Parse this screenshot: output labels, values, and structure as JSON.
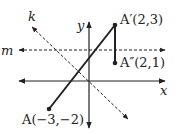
{
  "diagram": {
    "axes": {
      "x_label": "x",
      "y_label": "y"
    },
    "lines": {
      "k_label": "k",
      "m_label": "m"
    },
    "points": {
      "A": {
        "label": "A(−3,−2)"
      },
      "A_prime": {
        "label": "A′(2,3)"
      },
      "A_double_prime": {
        "label": "A″(2,1)"
      }
    },
    "colors": {
      "ink": "#222222"
    }
  }
}
